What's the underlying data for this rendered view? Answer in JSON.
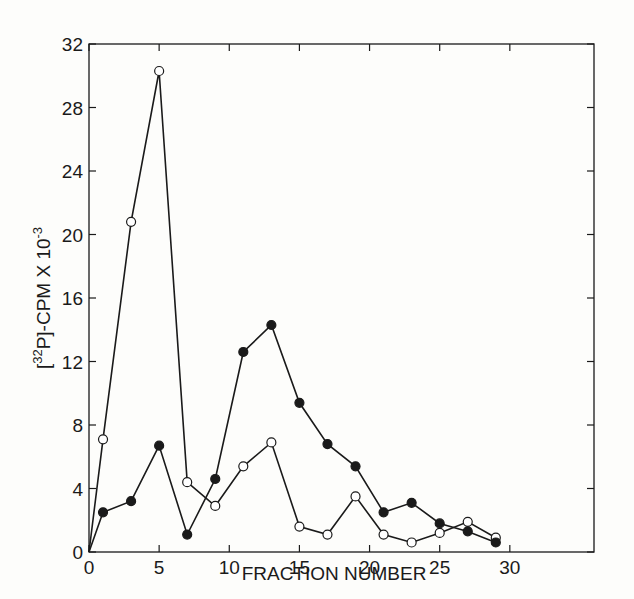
{
  "chart_data": {
    "type": "line",
    "title": "",
    "xlabel": "FRACTION NUMBER",
    "ylabel": "[32P]-CPM X 10-3",
    "ylabel_parts": {
      "open": "[",
      "sup": "32",
      "main": "P]-CPM X 10",
      "exp": "-3"
    },
    "xlim": [
      0,
      36
    ],
    "ylim": [
      0,
      32
    ],
    "xticks": [
      0,
      5,
      10,
      15,
      20,
      25,
      30
    ],
    "yticks": [
      0,
      4,
      8,
      12,
      16,
      20,
      24,
      28,
      32
    ],
    "grid": false,
    "legend": "none",
    "x": [
      0,
      1,
      3,
      5,
      7,
      9,
      11,
      13,
      15,
      17,
      19,
      21,
      23,
      25,
      27,
      29
    ],
    "series": [
      {
        "name": "open circles",
        "marker": "open-circle",
        "values": [
          0,
          7.1,
          20.8,
          30.3,
          4.4,
          2.9,
          5.4,
          6.9,
          1.6,
          1.1,
          3.5,
          1.1,
          0.6,
          1.2,
          1.9,
          0.9
        ]
      },
      {
        "name": "filled circles",
        "marker": "filled-circle",
        "values": [
          0,
          2.5,
          3.2,
          6.7,
          1.1,
          4.6,
          12.6,
          14.3,
          9.4,
          6.8,
          5.4,
          2.5,
          3.1,
          1.8,
          1.3,
          0.6
        ]
      }
    ]
  },
  "colors": {
    "ink": "#1a1a1a",
    "background": "#fdfdfb"
  }
}
